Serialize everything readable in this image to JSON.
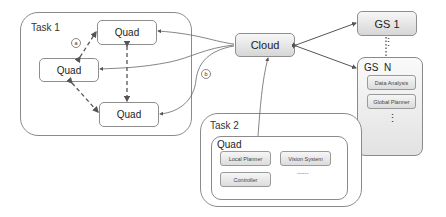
{
  "task1": {
    "label": "Task 1",
    "quads": [
      {
        "label": "Quad"
      },
      {
        "label": "Quad"
      },
      {
        "label": "Quad"
      }
    ],
    "badge_a": "a"
  },
  "badge_b": "b",
  "cloud": {
    "label": "Cloud"
  },
  "gs1": {
    "label": "GS 1"
  },
  "gs_dots": "⋮",
  "gsn": {
    "label": "GS  N",
    "modules": [
      {
        "label": "Data Analysis"
      },
      {
        "label": "Global Planner"
      }
    ],
    "more": "⋮"
  },
  "task2": {
    "label": "Task 2",
    "quad": {
      "label": "Quad",
      "modules": [
        {
          "label": "Local Planner"
        },
        {
          "label": "Vision System"
        },
        {
          "label": "Controller"
        }
      ],
      "more": "......"
    }
  },
  "colors": {
    "line": "#666666",
    "border": "#8a8a8a",
    "gradient_top": "#f7f7f7",
    "gradient_bottom": "#d6d6d6"
  }
}
